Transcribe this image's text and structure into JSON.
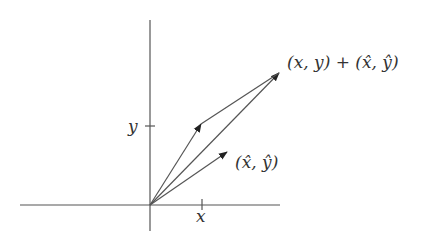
{
  "diagram": {
    "type": "vector-addition",
    "colors": {
      "stroke": "#555555",
      "text": "#333333",
      "background": "#ffffff"
    },
    "axes": {
      "x_label": "x",
      "y_label": "y"
    },
    "vectors": [
      {
        "name": "(x,y)",
        "from": [
          150,
          205
        ],
        "to": [
          201,
          124
        ]
      },
      {
        "name": "(x̂,ŷ)",
        "from": [
          150,
          205
        ],
        "to": [
          227,
          152
        ]
      },
      {
        "name": "sum",
        "from": [
          150,
          205
        ],
        "to": [
          279,
          73
        ]
      },
      {
        "name": "translated (x̂,ŷ)",
        "from": [
          201,
          124
        ],
        "to": [
          279,
          73
        ]
      }
    ],
    "labels": {
      "sum": "(x, y) + (x̂, ŷ)",
      "hat_vector": "(x̂, ŷ)"
    }
  }
}
